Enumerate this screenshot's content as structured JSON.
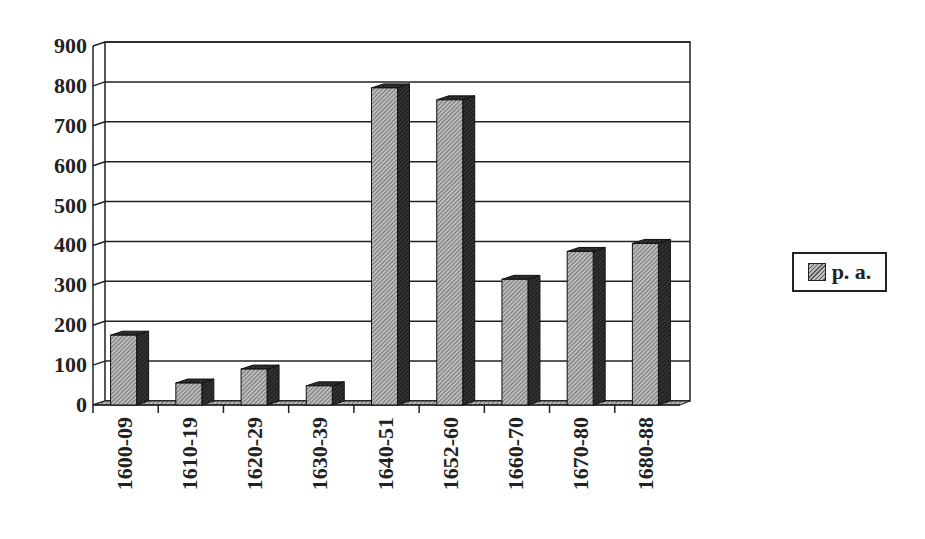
{
  "chart_data": {
    "type": "bar",
    "title": "",
    "xlabel": "",
    "ylabel": "",
    "categories": [
      "1600-09",
      "1610-19",
      "1620-29",
      "1630-39",
      "1640-51",
      "1652-60",
      "1660-70",
      "1670-80",
      "1680-88"
    ],
    "series": [
      {
        "name": "p. a.",
        "values": [
          175,
          55,
          90,
          48,
          795,
          765,
          315,
          385,
          405
        ]
      }
    ],
    "ylim": [
      0,
      900
    ],
    "yticks": [
      0,
      100,
      200,
      300,
      400,
      500,
      600,
      700,
      800,
      900
    ],
    "grid": true,
    "legend_position": "right",
    "style": "3d-hatched"
  },
  "legend": {
    "label": "p. a."
  }
}
